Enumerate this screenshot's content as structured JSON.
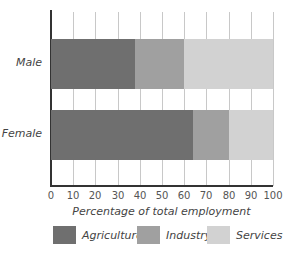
{
  "chart_data": {
    "type": "bar",
    "orientation": "horizontal",
    "stacked": true,
    "title": "",
    "xlabel": "Percentage of total employment",
    "ylabel": "",
    "xlim": [
      0,
      100
    ],
    "xticks": [
      0,
      10,
      20,
      30,
      40,
      50,
      60,
      70,
      80,
      90,
      100
    ],
    "grid": true,
    "legend_position": "bottom",
    "categories": [
      "Male",
      "Female"
    ],
    "series": [
      {
        "name": "Agriculture",
        "color": "#6f6f6f",
        "values": [
          38,
          64
        ]
      },
      {
        "name": "Industry",
        "color": "#a0a0a0",
        "values": [
          22,
          16
        ]
      },
      {
        "name": "Services",
        "color": "#d2d2d2",
        "values": [
          40,
          20
        ]
      }
    ]
  },
  "labels": {
    "male": "Male",
    "female": "Female",
    "xlabel": "Percentage of total employment",
    "ticks": [
      "0",
      "10",
      "20",
      "30",
      "40",
      "50",
      "60",
      "70",
      "80",
      "90",
      "100"
    ],
    "legend": [
      "Agriculture",
      "Industry",
      "Services"
    ]
  }
}
